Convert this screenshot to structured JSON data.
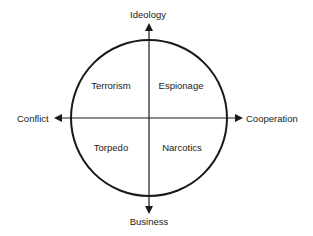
{
  "diagram": {
    "type": "quadrant-circle",
    "axes": {
      "top": "Ideology",
      "bottom": "Business",
      "left": "Conflict",
      "right": "Cooperation"
    },
    "quadrants": {
      "top_left": "Terrorism",
      "top_right": "Espionage",
      "bottom_left": "Torpedo",
      "bottom_right": "Narcotics"
    },
    "colors": {
      "line": "#1a1a1a",
      "background": "#ffffff"
    }
  }
}
